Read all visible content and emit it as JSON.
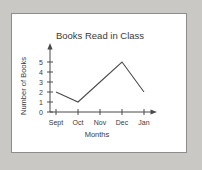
{
  "panel": {
    "background_color": "#ffffff",
    "border_color": "#8d8d8d",
    "page_background_color": "#c9c8c4"
  },
  "chart_data": {
    "type": "line",
    "title": "Books Read in Class",
    "xlabel": "Months",
    "ylabel": "Number of Books",
    "categories": [
      "Sept",
      "Oct",
      "Nov",
      "Dec",
      "Jan"
    ],
    "values": [
      2,
      1,
      3,
      5,
      2
    ],
    "ytick_labels": [
      "0",
      "1",
      "2",
      "3",
      "4",
      "5"
    ],
    "ylim": [
      0,
      6
    ],
    "grid": false,
    "legend": "none",
    "line_color": "#4d4d4d",
    "axis_color": "#4a4a4a",
    "axis_arrows": true
  }
}
